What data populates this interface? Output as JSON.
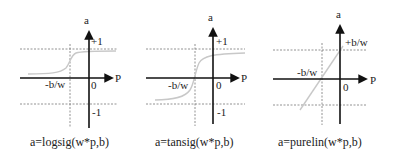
{
  "panels": [
    {
      "name": "logsig",
      "caption": "a=logsig(w*p,b)",
      "y_axis_label": "a",
      "x_axis_label": "P",
      "origin_label": "0",
      "upper_label": "+1",
      "lower_label": "-1",
      "shift_label": "-b/w"
    },
    {
      "name": "tansig",
      "caption": "a=tansig(w*p,b)",
      "y_axis_label": "a",
      "x_axis_label": "P",
      "origin_label": "0",
      "upper_label": "+1",
      "lower_label": "-1",
      "shift_label": "-b/w"
    },
    {
      "name": "purelin",
      "caption": "a=purelin(w*p,b)",
      "y_axis_label": "a",
      "x_axis_label": "P",
      "origin_label": "0",
      "upper_label": "+b/w",
      "shift_label": "-b/w"
    }
  ],
  "colors": {
    "axis": "#111111",
    "curve": "#c8c8c8",
    "dashed": "#777777"
  }
}
